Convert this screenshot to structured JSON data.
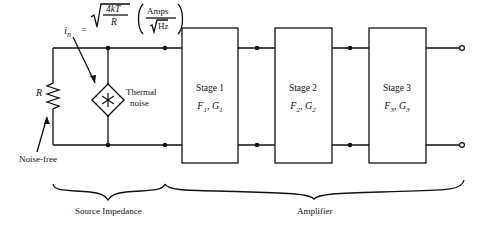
{
  "formula": {
    "lhs": "i",
    "lhs_sub": "n",
    "equals": "=",
    "numerator": "4kT",
    "denominator": "R",
    "unit_numerator": "Amps",
    "unit_denominator": "Hz"
  },
  "labels": {
    "resistor": "R",
    "noise_source_line1": "Thermal",
    "noise_source_line2": "noise",
    "noise_source_symbol": "*",
    "noise_free": "Noise-free",
    "source_impedance": "Source Impedance",
    "amplifier": "Amplifier"
  },
  "stages": [
    {
      "title": "Stage 1",
      "params": "F1, G1",
      "F": "F",
      "F_sub": "1",
      "G": "G",
      "G_sub": "1"
    },
    {
      "title": "Stage 2",
      "params": "F2, G2",
      "F": "F",
      "F_sub": "2",
      "G": "G",
      "G_sub": "2"
    },
    {
      "title": "Stage 3",
      "params": "F3, G3",
      "F": "F",
      "F_sub": "3",
      "G": "G",
      "G_sub": "3"
    }
  ]
}
